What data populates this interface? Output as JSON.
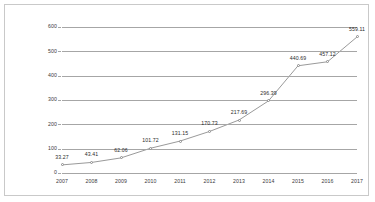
{
  "chart_data": {
    "type": "line",
    "title": "",
    "xlabel": "",
    "ylabel": "",
    "categories": [
      "2007",
      "2008",
      "2009",
      "2010",
      "2011",
      "2012",
      "2013",
      "2014",
      "2015",
      "2016",
      "2017"
    ],
    "values": [
      33.27,
      43.41,
      62.06,
      101.72,
      131.15,
      170.73,
      217.69,
      296.39,
      440.69,
      457.12,
      559.11
    ],
    "point_labels": [
      "33.27",
      "43.41",
      "62.06",
      "101.72",
      "131.15",
      "170.73",
      "217.69",
      "296.39",
      "440.69",
      "457.12",
      "559.11"
    ],
    "ylim": [
      0,
      600
    ],
    "yticks": [
      0,
      100,
      200,
      300,
      400,
      500,
      600
    ],
    "ytick_labels": [
      "0",
      "100",
      "200",
      "300",
      "400",
      "500",
      "600"
    ],
    "grid": true,
    "legend": false,
    "legend_position": "none",
    "series": [
      {
        "name": "",
        "values": [
          33.27,
          43.41,
          62.06,
          101.72,
          131.15,
          170.73,
          217.69,
          296.39,
          440.69,
          457.12,
          559.11
        ],
        "line_color": "#9a9a9a",
        "marker": "circle",
        "marker_color": "#8c8c8c"
      }
    ],
    "colors": {
      "line": "#9a9a9a",
      "gridline": "#a6a6a6",
      "axis": "#a6a6a6",
      "border": "#c9c9c9",
      "background": "#ffffff",
      "label_text": "#2b2b2b",
      "tick_text": "#3a3a3a"
    }
  }
}
